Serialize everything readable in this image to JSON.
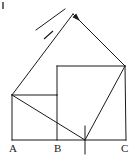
{
  "figure": {
    "kind": "geometry-diagram",
    "stroke_color": "#1a1a1a",
    "background_color": "#ffffff",
    "stroke_width": 1,
    "canvas": {
      "width": 135,
      "height": 159
    }
  },
  "labels": {
    "a": "A",
    "b": "B",
    "c": "C"
  },
  "points": {
    "A": {
      "x": 12,
      "y": 140
    },
    "B": {
      "x": 57,
      "y": 140
    },
    "C": {
      "x": 126,
      "y": 140
    },
    "P": {
      "x": 85,
      "y": 140
    },
    "L": {
      "x": 12,
      "y": 95
    },
    "M": {
      "x": 57,
      "y": 95
    },
    "N": {
      "x": 57,
      "y": 66
    },
    "Q": {
      "x": 125,
      "y": 66
    },
    "T": {
      "x": 73,
      "y": 14
    },
    "U": {
      "x": 33,
      "y": 24
    }
  },
  "segments": [
    {
      "name": "baseline-A-C",
      "x1": 12,
      "y1": 140,
      "x2": 126,
      "y2": 140
    },
    {
      "name": "left-square-left-side",
      "x1": 12,
      "y1": 140,
      "x2": 12,
      "y2": 95
    },
    {
      "name": "left-square-top-side",
      "x1": 12,
      "y1": 95,
      "x2": 57,
      "y2": 95
    },
    {
      "name": "left-square-right-side",
      "x1": 57,
      "y1": 95,
      "x2": 57,
      "y2": 140
    },
    {
      "name": "inner-square-left-side",
      "x1": 57,
      "y1": 95,
      "x2": 57,
      "y2": 66
    },
    {
      "name": "inner-square-top-side",
      "x1": 57,
      "y1": 66,
      "x2": 125,
      "y2": 66
    },
    {
      "name": "inner-square-right-side",
      "x1": 125,
      "y1": 66,
      "x2": 126,
      "y2": 140
    },
    {
      "name": "diagonal-L-to-P",
      "x1": 12,
      "y1": 95,
      "x2": 85,
      "y2": 140
    },
    {
      "name": "diagonal-P-to-Q",
      "x1": 85,
      "y1": 140,
      "x2": 125,
      "y2": 66
    },
    {
      "name": "tilted-square-left-side",
      "x1": 12,
      "y1": 95,
      "x2": 73,
      "y2": 14
    },
    {
      "name": "tilted-square-top-side",
      "x1": 73,
      "y1": 14,
      "x2": 125,
      "y2": 66
    },
    {
      "name": "tick-cross-upper",
      "x1": 36,
      "y1": 30,
      "x2": 65,
      "y2": 9
    },
    {
      "name": "tick-vertical-at-P",
      "x1": 85,
      "y1": 126,
      "x2": 85,
      "y2": 154
    }
  ],
  "hash_marks": [
    {
      "name": "hash-on-left-tilted-side",
      "x1": 44,
      "y1": 39,
      "x2": 53,
      "y2": 31
    }
  ],
  "arrow_heads": [
    {
      "name": "arrowhead-on-top-tilted-side",
      "x": 80,
      "y": 21,
      "angle_deg": 45
    }
  ]
}
